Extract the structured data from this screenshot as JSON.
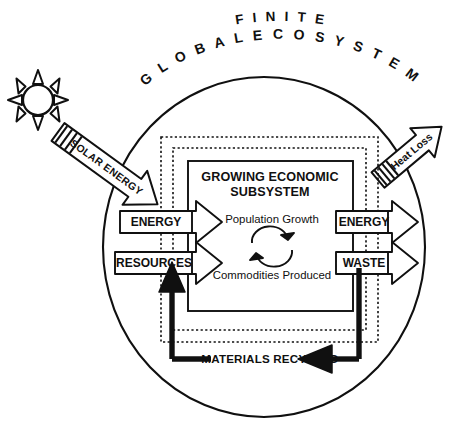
{
  "diagram": {
    "title_arc_top": "F I N I T E",
    "title_arc_bottom": "G L O B A L   E C O S Y S T E M",
    "subsystem_heading_line1": "GROWING ECONOMIC",
    "subsystem_heading_line2": "SUBSYSTEM",
    "inner_label_top": "Population Growth",
    "inner_label_bottom": "Commodities Produced",
    "cycle_icon_name": "circular-recycle-arrows",
    "sun_icon_name": "sun-icon",
    "colors": {
      "ink": "#101010",
      "background": "#ffffff"
    }
  },
  "inputs": {
    "solar": {
      "label": "SOLAR ENERGY",
      "direction": "down-right",
      "hatched": true
    },
    "energy_in": {
      "label": "ENERGY",
      "direction": "right"
    },
    "resources_in": {
      "label": "RESOURCES",
      "direction": "right"
    }
  },
  "outputs": {
    "heat_loss": {
      "label": "Heat Loss",
      "direction": "up-right",
      "hatched": true
    },
    "energy_out": {
      "label": "ENERGY",
      "direction": "right"
    },
    "waste_out": {
      "label": "WASTE",
      "direction": "right"
    }
  },
  "feedback": {
    "label": "MATERIALS RECYCLED",
    "direction": "right-to-left"
  },
  "boundaries": {
    "ecosystem_shape": "ellipse",
    "dashed_layers": 2,
    "solid_subsystem_box": true
  }
}
